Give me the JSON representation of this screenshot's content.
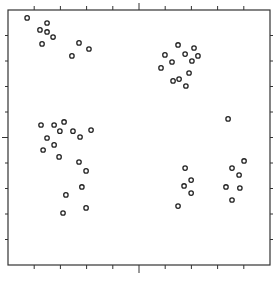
{
  "chart_data": {
    "type": "scatter",
    "title": "",
    "xlabel": "",
    "ylabel": "",
    "xlim": [
      0,
      10
    ],
    "ylim": [
      0,
      10
    ],
    "grid": false,
    "legend": null,
    "marker": "open-circle",
    "x_ticks": [
      1,
      2,
      3,
      4,
      5,
      6,
      7,
      8,
      9
    ],
    "y_ticks": [
      1,
      2,
      3,
      4,
      5,
      6,
      7,
      8,
      9
    ],
    "major_tick": {
      "x": 5,
      "y": 5
    },
    "tick_labels_visible": false,
    "series": [
      {
        "name": "cluster-upper-left",
        "points": [
          [
            0.73,
            9.69
          ],
          [
            1.49,
            9.49
          ],
          [
            1.22,
            9.22
          ],
          [
            1.49,
            9.14
          ],
          [
            1.72,
            8.94
          ],
          [
            1.3,
            8.67
          ],
          [
            2.71,
            8.71
          ],
          [
            3.09,
            8.47
          ],
          [
            2.44,
            8.2
          ]
        ]
      },
      {
        "name": "cluster-upper-right",
        "points": [
          [
            6.49,
            8.63
          ],
          [
            7.1,
            8.51
          ],
          [
            5.99,
            8.24
          ],
          [
            6.76,
            8.27
          ],
          [
            7.25,
            8.2
          ],
          [
            6.26,
            7.96
          ],
          [
            7.02,
            8.0
          ],
          [
            5.84,
            7.73
          ],
          [
            6.91,
            7.53
          ],
          [
            6.3,
            7.22
          ],
          [
            6.53,
            7.29
          ],
          [
            6.79,
            7.02
          ]
        ]
      },
      {
        "name": "cluster-lower-left",
        "points": [
          [
            1.26,
            5.49
          ],
          [
            1.76,
            5.49
          ],
          [
            2.14,
            5.61
          ],
          [
            1.98,
            5.25
          ],
          [
            2.48,
            5.25
          ],
          [
            3.17,
            5.29
          ],
          [
            1.49,
            4.98
          ],
          [
            2.75,
            5.02
          ],
          [
            1.34,
            4.51
          ],
          [
            1.76,
            4.71
          ],
          [
            1.95,
            4.24
          ],
          [
            2.71,
            4.04
          ],
          [
            2.98,
            3.69
          ],
          [
            2.82,
            3.06
          ],
          [
            2.21,
            2.75
          ],
          [
            2.98,
            2.24
          ],
          [
            2.1,
            2.04
          ]
        ]
      },
      {
        "name": "cluster-lower-right",
        "points": [
          [
            6.76,
            3.8
          ],
          [
            6.99,
            3.33
          ],
          [
            6.72,
            3.1
          ],
          [
            6.99,
            2.82
          ],
          [
            6.49,
            2.31
          ],
          [
            8.4,
            5.73
          ],
          [
            9.01,
            4.08
          ],
          [
            8.55,
            3.8
          ],
          [
            8.82,
            3.53
          ],
          [
            8.32,
            3.06
          ],
          [
            8.85,
            3.02
          ],
          [
            8.55,
            2.55
          ]
        ]
      }
    ]
  }
}
